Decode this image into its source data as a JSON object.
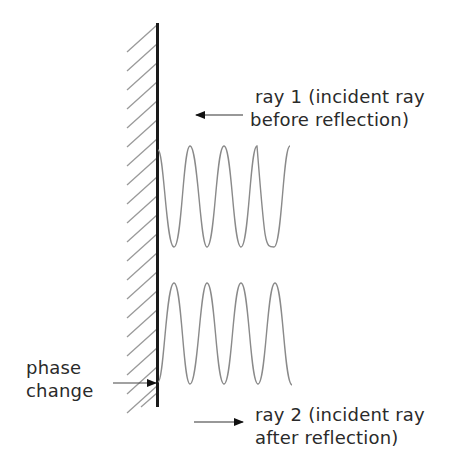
{
  "diagram": {
    "type": "physics-reflection",
    "wall": {
      "label": "reflecting surface",
      "color": "#1a1a1a",
      "hatch_color": "#9a9a9a"
    },
    "wave_color": "#8a8a8a",
    "labels": {
      "ray1": {
        "line1": "ray 1 (incident ray",
        "line2": "before reflection)",
        "arrow_direction": "left"
      },
      "ray2": {
        "line1": "ray 2 (incident ray",
        "line2": "after reflection)",
        "arrow_direction": "right"
      },
      "phase": {
        "line1": "phase",
        "line2": "change",
        "arrow_direction": "right"
      }
    }
  }
}
